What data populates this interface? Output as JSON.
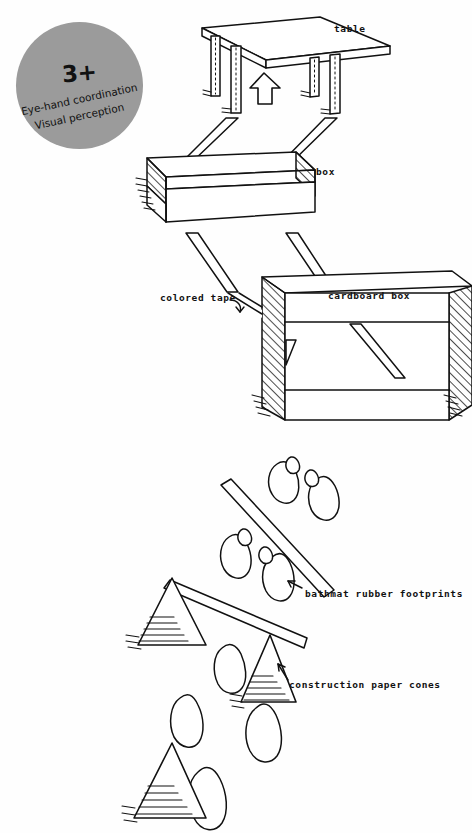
{
  "page": {
    "background_color": "#ffffff",
    "ink_color": "#111111",
    "width": 472,
    "height": 833,
    "style": "hand-drawn instructional diagram"
  },
  "badge": {
    "fill_color": "#9b9b9b",
    "age_label": "3+",
    "skills": [
      "Eye-hand coordination",
      "Visual perception"
    ]
  },
  "labels": {
    "table": "table",
    "box": "box",
    "cardboard_box": "cardboard box",
    "colored_tape": "colored tape",
    "footprints": "bathmat rubber footprints",
    "cones": "construction paper cones"
  },
  "scene": {
    "elements": [
      {
        "name": "table",
        "label": "table"
      },
      {
        "name": "open-box",
        "label": "box"
      },
      {
        "name": "cardboard-tunnel-box",
        "label": "cardboard box"
      },
      {
        "name": "tape-strips",
        "label": "colored tape"
      },
      {
        "name": "footprint-pairs",
        "label": "bathmat rubber footprints"
      },
      {
        "name": "paper-cones",
        "label": "construction paper cones"
      }
    ],
    "arrow_direction": "up"
  }
}
